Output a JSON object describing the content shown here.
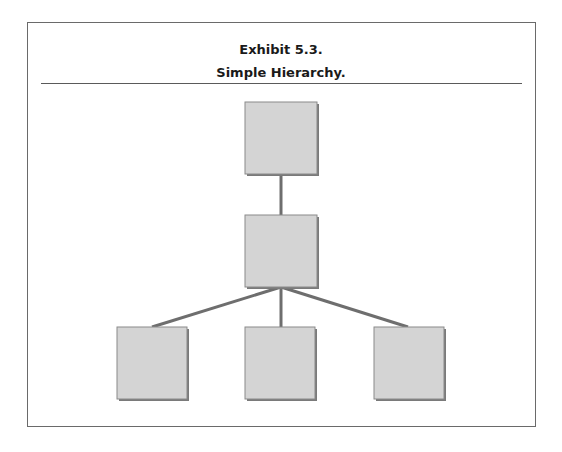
{
  "exhibit": {
    "title_line1": "Exhibit 5.3.",
    "title_line2": "Simple Hierarchy."
  },
  "diagram": {
    "type": "hierarchy",
    "box_fill": "#d4d4d4",
    "box_stroke": "#8a8a8a",
    "shadow": "#7a7a7a",
    "line_color": "#6e6e6e",
    "levels": [
      {
        "level": 1,
        "nodes": [
          "top"
        ]
      },
      {
        "level": 2,
        "nodes": [
          "middle"
        ]
      },
      {
        "level": 3,
        "nodes": [
          "bottom-left",
          "bottom-center",
          "bottom-right"
        ]
      }
    ]
  }
}
